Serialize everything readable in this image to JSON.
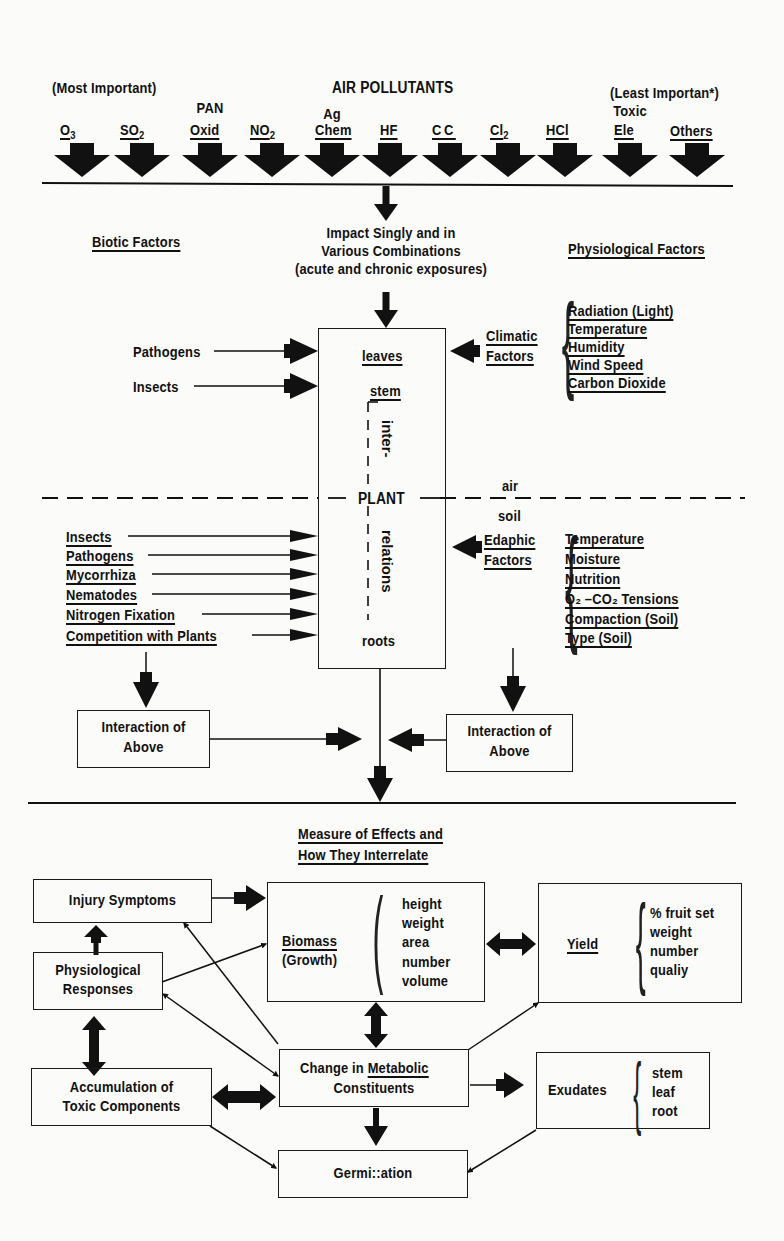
{
  "top": {
    "title": "AIR POLLUTANTS",
    "most_important": "(Most Important)",
    "least_important": "(Least Importan*)",
    "pollutants": [
      {
        "top": "",
        "label": "O",
        "sub": "3"
      },
      {
        "top": "",
        "label": "SO",
        "sub": "2"
      },
      {
        "top": "PAN",
        "label": "Oxid",
        "sub": ""
      },
      {
        "top": "",
        "label": "NO",
        "sub": "2"
      },
      {
        "top": "Ag",
        "label": "Chem",
        "sub": ""
      },
      {
        "top": "",
        "label": "HF",
        "sub": ""
      },
      {
        "top": "",
        "label": "CC",
        "sub": ""
      },
      {
        "top": "",
        "label": "Cl",
        "sub": "2"
      },
      {
        "top": "",
        "label": "HCl",
        "sub": ""
      },
      {
        "top": "Toxic",
        "label": "Ele",
        "sub": ""
      },
      {
        "top": "",
        "label": "Others",
        "sub": ""
      }
    ]
  },
  "impact": {
    "line1": "Impact Singly and in",
    "line2": "Various Combinations",
    "line3": "(acute and chronic exposures)"
  },
  "biotic": {
    "heading": "Biotic Factors",
    "above_ground": [
      "Pathogens",
      "Insects"
    ],
    "below_ground": [
      "Insects",
      "Pathogens",
      "Mycorrhiza",
      "Nematodes",
      "Nitrogen Fixation",
      "Competition with Plants"
    ],
    "interaction": {
      "line1": "Interaction of",
      "line2": "Above"
    }
  },
  "physiological": {
    "heading": "Physiological Factors",
    "climatic_label": {
      "line1": "Climatic",
      "line2": "Factors"
    },
    "climatic_items": [
      "Radiation (Light)",
      "Temperature",
      "Humidity",
      "Wind Speed",
      "Carbon Dioxide"
    ],
    "edaphic_label": {
      "line1": "Edaphic",
      "line2": "Factors"
    },
    "edaphic_items": [
      "Temperature",
      "Moisture",
      "Nutrition",
      "O₂ –CO₂ Tensions",
      "Compaction (Soil)",
      "Type (Soil)"
    ],
    "interaction": {
      "line1": "Interaction of",
      "line2": "Above"
    }
  },
  "plant": {
    "leaves": "leaves",
    "stem": "stem",
    "inter": "inter-",
    "center": "PLANT",
    "relations": "relations",
    "roots": "roots",
    "air": "air",
    "soil": "soil"
  },
  "effects": {
    "heading_line1": "Measure of Effects and",
    "heading_line2": "How They Interrelate",
    "injury": "Injury Symptoms",
    "physiological": {
      "line1": "Physiological",
      "line2": "Responses"
    },
    "accumulation": {
      "line1": "Accumulation of",
      "line2": "Toxic Components"
    },
    "biomass": {
      "label": "Biomass",
      "sub": "(Growth)",
      "items": [
        "height",
        "weight",
        "area",
        "number",
        "volume"
      ]
    },
    "yield": {
      "label": "Yield",
      "items": [
        "% fruit set",
        "weight",
        "number",
        "qualiy"
      ]
    },
    "metabolic": {
      "line1_a": "Change in ",
      "line1_b": "Metabolic",
      "line2": "Constituents"
    },
    "exudates": {
      "label": "Exudates",
      "items": [
        "stem",
        "leaf",
        "root"
      ]
    },
    "germination": "Germi::ation"
  }
}
